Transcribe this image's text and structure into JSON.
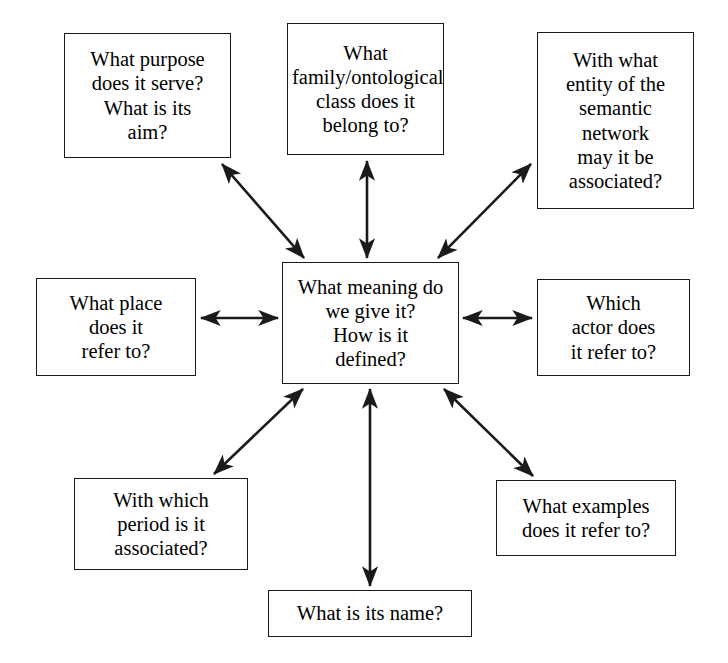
{
  "diagram": {
    "style": {
      "line_color": "#1a1a1a",
      "box_fill": "#ffffff",
      "text_color": "#000000",
      "background": "#ffffff"
    },
    "center": {
      "id": "center",
      "text": "What meaning do\nwe give it?\nHow is it\ndefined?"
    },
    "nodes": [
      {
        "id": "top-left",
        "text": "What purpose\ndoes it serve?\nWhat is its\naim?"
      },
      {
        "id": "top-center",
        "text": "What\nfamily/ontological\nclass does it\nbelong to?"
      },
      {
        "id": "top-right",
        "text": "With what\nentity of the\nsemantic\nnetwork\nmay it be\nassociated?"
      },
      {
        "id": "mid-left",
        "text": "What place\ndoes it\nrefer to?"
      },
      {
        "id": "mid-right",
        "text": "Which\nactor does\nit refer to?"
      },
      {
        "id": "bottom-left",
        "text": "With which\nperiod is it\nassociated?"
      },
      {
        "id": "bottom-center",
        "text": "What is its name?"
      },
      {
        "id": "bottom-right",
        "text": "What examples\ndoes it refer to?"
      }
    ],
    "connectors": [
      {
        "from": "center",
        "to": "top-left",
        "arrowheads": "both",
        "orientation": "diagonal"
      },
      {
        "from": "center",
        "to": "top-center",
        "arrowheads": "both",
        "orientation": "vertical"
      },
      {
        "from": "center",
        "to": "top-right",
        "arrowheads": "both",
        "orientation": "diagonal"
      },
      {
        "from": "center",
        "to": "mid-left",
        "arrowheads": "both",
        "orientation": "horizontal"
      },
      {
        "from": "center",
        "to": "mid-right",
        "arrowheads": "both",
        "orientation": "horizontal"
      },
      {
        "from": "center",
        "to": "bottom-left",
        "arrowheads": "both",
        "orientation": "diagonal"
      },
      {
        "from": "center",
        "to": "bottom-center",
        "arrowheads": "both",
        "orientation": "vertical"
      },
      {
        "from": "center",
        "to": "bottom-right",
        "arrowheads": "both",
        "orientation": "diagonal"
      }
    ]
  }
}
